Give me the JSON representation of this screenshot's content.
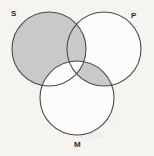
{
  "figure": {
    "kind": "venn-diagram",
    "background_color": "#f6f4f1",
    "stroke_color": "#4a4a4a",
    "shade_color": "#c9c9c9",
    "unshaded_color": "#fdfcfa"
  },
  "circles": [
    {
      "id": "S",
      "label": "S",
      "cx": 49,
      "cy": 49,
      "r": 37,
      "label_position": "top-left"
    },
    {
      "id": "P",
      "label": "P",
      "cx": 104,
      "cy": 49,
      "r": 37,
      "label_position": "top-right"
    },
    {
      "id": "M",
      "label": "M",
      "cx": 77,
      "cy": 98,
      "r": 37,
      "label_position": "bottom-center"
    }
  ],
  "regions": [
    {
      "id": "S-only",
      "description": "S not P not M",
      "shaded": true
    },
    {
      "id": "SP",
      "description": "S and P not M",
      "shaded": true
    },
    {
      "id": "SM",
      "description": "S and M not P",
      "shaded": false
    },
    {
      "id": "SPM",
      "description": "S and P and M",
      "shaded": false
    },
    {
      "id": "PM",
      "description": "P and M not S",
      "shaded": true
    },
    {
      "id": "P-only",
      "description": "P not S not M",
      "shaded": false
    },
    {
      "id": "M-only",
      "description": "M not S not P",
      "shaded": false
    }
  ],
  "bleed_text": [
    {
      "text": "inclusion",
      "x": 86,
      "y": 20
    },
    {
      "text": "the S or",
      "x": 92,
      "y": 38
    },
    {
      "text": "another",
      "x": 90,
      "y": 50
    },
    {
      "text": "conclusion",
      "x": 74,
      "y": 86
    },
    {
      "text": "premises",
      "x": 80,
      "y": 100
    },
    {
      "text": "validity",
      "x": 86,
      "y": 114
    },
    {
      "text": "diagram",
      "x": 72,
      "y": 130
    }
  ]
}
